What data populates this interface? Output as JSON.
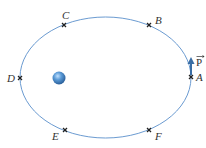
{
  "diagram": {
    "colors": {
      "orbit": "#6b9bd1",
      "marker": "#222222",
      "planet": "#3b82c4",
      "arrow": "#3a6ea5"
    },
    "orbit": {
      "cx": 105.5,
      "cy": 77.5,
      "rx": 85.5,
      "ry": 60.5
    },
    "body": {
      "name": "central-body",
      "cx": 59,
      "cy": 78,
      "r": 6
    },
    "points": [
      {
        "id": "A",
        "label": "A",
        "x": 191,
        "y": 77
      },
      {
        "id": "B",
        "label": "B",
        "x": 149,
        "y": 25
      },
      {
        "id": "C",
        "label": "C",
        "x": 64,
        "y": 25
      },
      {
        "id": "D",
        "label": "D",
        "x": 20,
        "y": 78
      },
      {
        "id": "E",
        "label": "E",
        "x": 65,
        "y": 130
      },
      {
        "id": "F",
        "label": "F",
        "x": 149,
        "y": 130
      }
    ],
    "vector": {
      "label": "P",
      "has_arrow_over": true,
      "from": "A",
      "direction": "up"
    }
  }
}
